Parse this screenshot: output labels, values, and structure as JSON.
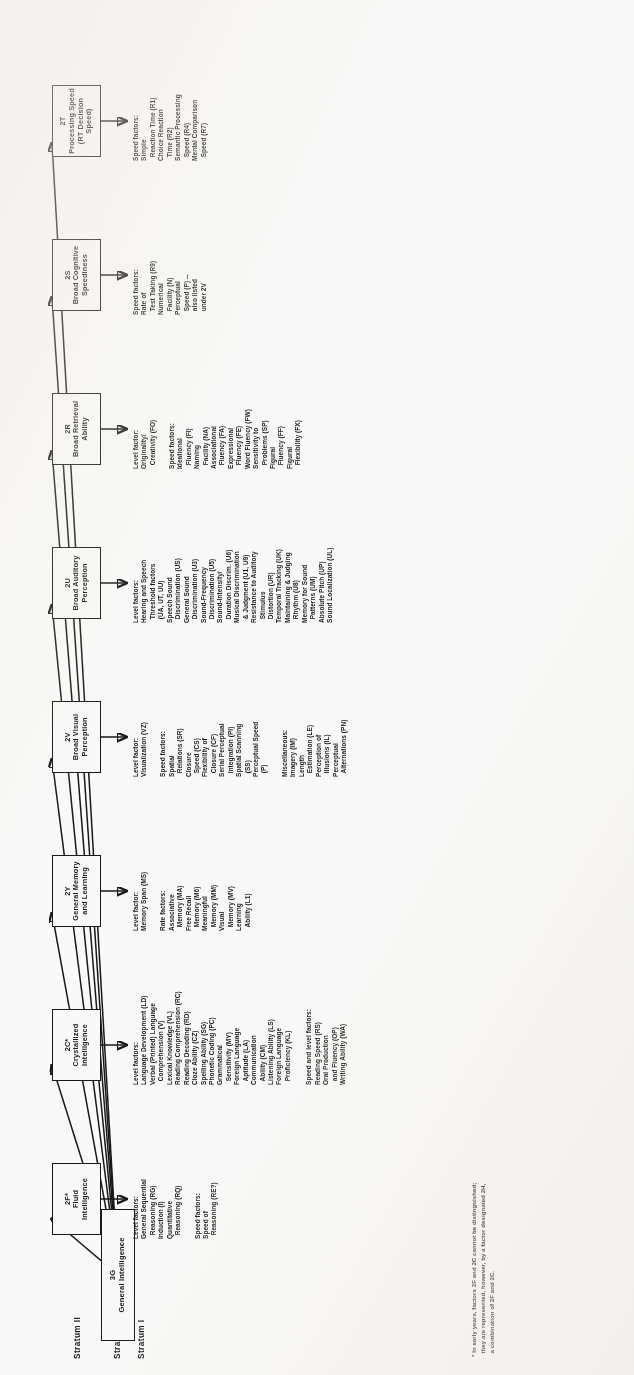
{
  "figure": {
    "strata": [
      {
        "id": "stratum-3",
        "label": "Stratum III"
      },
      {
        "id": "stratum-2",
        "label": "Stratum II"
      },
      {
        "id": "stratum-1",
        "label": "Stratum I"
      }
    ],
    "general": {
      "code": "3G",
      "name": "General Intelligence"
    },
    "footnote": "* In early years, factors 2F and 2C cannot be distinguished;\n  they are represented, however, by a factor designated 2H,\n  a combination of 2F and 2C.",
    "columns": [
      {
        "code": "2F*",
        "name": "Fluid\nIntelligence",
        "groups": [
          {
            "heading": "Level factors:",
            "items": [
              "General Sequential",
              "  Reasoning (RG)",
              "Induction (I)",
              "Quantitative",
              "  Reasoning (RQ)"
            ]
          },
          {
            "heading": "Speed factors:",
            "items": [
              "Speed of",
              "  Reasoning (RE?)"
            ]
          }
        ]
      },
      {
        "code": "2C*",
        "name": "Crystallized\nIntelligence",
        "groups": [
          {
            "heading": "Level factors:",
            "items": [
              "Language Development (LD)",
              "Verbal (Printed) Language",
              "  Comprehension (V)",
              "Lexical Knowledge (VL)",
              "Reading Comprehension (RC)",
              "Reading Decoding (RD)",
              "Cloze Ability (CZ)",
              "Spelling Ability (SG)",
              "Phonetic Coding (PC)",
              "Grammatical",
              "  Sensitivity (MY)",
              "Foreign Language",
              "  Aptitude (LA)",
              "Communication",
              "  Ability (CM)",
              "Listening Ability (LS)",
              "Foreign Language",
              "  Proficiency (KL)"
            ]
          },
          {
            "heading": "Speed and level factors:",
            "items": [
              "Reading Speed (RS)",
              "Oral Production",
              "  and Fluency (OP)",
              "Writing Ability (WA)"
            ]
          }
        ]
      },
      {
        "code": "2Y",
        "name": "General Memory\nand Learning",
        "groups": [
          {
            "heading": "Level factor:",
            "items": [
              "Memory Span (MS)"
            ]
          },
          {
            "heading": "Rate factors:",
            "items": [
              "Associative",
              "  Memory (MA)",
              "Free Recall",
              "  Memory (M6)",
              "Meaningful",
              "  Memory (MM)",
              "Visual",
              "  Memory (MV)",
              "Learning",
              "  Ability (L1)"
            ]
          }
        ]
      },
      {
        "code": "2V",
        "name": "Broad Visual\nPerception",
        "groups": [
          {
            "heading": "Level factor:",
            "items": [
              "Visualization (VZ)"
            ]
          },
          {
            "heading": "Speed factors:",
            "items": [
              "Spatial",
              "  Relations (SR)",
              "Closure",
              "  Speed (CS)",
              "Flexibility of",
              "  Closure (CF)",
              "Serial Perceptual",
              "  Integration (PI)",
              "Spatial Scanning",
              "  (SS)",
              "Perceptual Speed",
              "  (P)"
            ]
          },
          {
            "heading": "Miscellaneous:",
            "items": [
              "Imagery (IM)",
              "Length",
              "  Estimation (LE)",
              "Perception of",
              "  Illusions (IL)",
              "Perceptual",
              "  Alternations (PN)"
            ]
          }
        ]
      },
      {
        "code": "2U",
        "name": "Broad Auditory\nPerception",
        "groups": [
          {
            "heading": "Level factors:",
            "items": [
              "Hearing and Speech",
              "  Threshold factors",
              "  (UA, UT, UU)",
              "Speech Sound",
              "  Discrimination (US)",
              "General Sound",
              "  Discrimination (U3)",
              "Sound-Frequency",
              "  Discrimination (U5)",
              "Sound-Intensity/",
              "  Duration Discrim. (U6)",
              "Musical Discrimination",
              "  & Judgment (U1, U9)",
              "Resistance to Auditory",
              "  Stimulus",
              "  Distortion (UR)",
              "Temporal Tracking (UK)",
              "Maintaining & Judging",
              "  Rhythm (U8)",
              "Memory for Sound",
              "  Patterns (UM)",
              "Absolute Pitch (UP)",
              "Sound Localization (UL)"
            ]
          }
        ]
      },
      {
        "code": "2R",
        "name": "Broad Retrieval\nAbility",
        "groups": [
          {
            "heading": "Level factor:",
            "items": [
              "Originality/",
              "  Creativity (FO)"
            ]
          },
          {
            "heading": "Speed factors:",
            "items": [
              "Ideational",
              "  Fluency (FI)",
              "Naming",
              "  Facility (NA)",
              "Associational",
              "  Fluency (FA)",
              "Expressional",
              "  Fluency (FE)",
              "Word Fluency (FW)",
              "Sensitivity to",
              "  Problems (SP)",
              "Figural",
              "  Fluency (FF)",
              "Figural",
              "  Flexibility (FX)"
            ]
          }
        ]
      },
      {
        "code": "2S",
        "name": "Broad Cognitive\nSpeediness",
        "groups": [
          {
            "heading": "Speed factors:",
            "items": [
              "Rate of",
              "  Test Taking (R9)",
              "Numerical",
              "  Facility (N)",
              "Perceptual",
              "  Speed (P) --",
              "  also listed",
              "  under 2V"
            ]
          }
        ]
      },
      {
        "code": "2T",
        "name": "Processing Speed\n(RT Decision Speed)",
        "groups": [
          {
            "heading": "Speed factors:",
            "items": [
              "Simple",
              "  Reaction Time (R1)",
              "Choice Reaction",
              "  Time (R2)",
              "Semantic Processing",
              "  Speed (R4)",
              "Mental Comparison",
              "  Speed (R7)"
            ]
          }
        ]
      }
    ]
  }
}
